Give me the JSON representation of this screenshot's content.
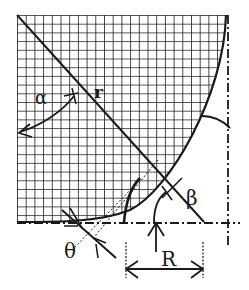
{
  "figure": {
    "colors": {
      "ink": "#1a1a1a",
      "background": "#ffffff"
    },
    "labels": {
      "alpha": "α",
      "r": "r",
      "beta": "β",
      "theta": "θ",
      "R": "R"
    },
    "annotations": [
      {
        "symbol": "α",
        "meaning": "angle between vertical and diagonal line"
      },
      {
        "symbol": "r",
        "meaning": "radial line from origin"
      },
      {
        "symbol": "β",
        "meaning": "angle at diagonal line near fillet"
      },
      {
        "symbol": "θ",
        "meaning": "contact angle at bottom"
      },
      {
        "symbol": "R",
        "meaning": "horizontal distance dimension"
      }
    ]
  }
}
